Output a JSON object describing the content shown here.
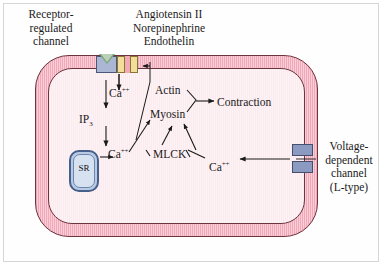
{
  "figure": {
    "type": "biological-pathway-diagram"
  },
  "labels": {
    "receptor_channel_line1": "Receptor-",
    "receptor_channel_line2": "regulated",
    "receptor_channel_line3": "channel",
    "agonist_1": "Angiotensin II",
    "agonist_2": "Norepinephrine",
    "agonist_3": "Endothelin",
    "voltage_channel_line1": "Voltage-",
    "voltage_channel_line2": "dependent",
    "voltage_channel_line3": "channel",
    "voltage_channel_line4": "(L-type)"
  },
  "molecules": {
    "calcium_influx": "Ca",
    "calcium_influx_charge": "++",
    "ip3": "IP",
    "ip3_subscript": "3",
    "calcium_sr": "Ca",
    "calcium_sr_charge": "++",
    "calcium_right": "Ca",
    "calcium_right_charge": "++",
    "actin": "Actin",
    "myosin": "Myosin",
    "mlck": "MLCK",
    "contraction": "Contraction",
    "sarcoplasmic_reticulum": "SR"
  },
  "colors": {
    "membrane": "#f3a8b8",
    "cytoplasm": "#fbeaee",
    "cell_outline": "#6b3540",
    "receptor_channel": "#aab6d4",
    "agonist_channel": "#f2dd9a",
    "voltage_channel": "#8a9ac0",
    "sr_body": "#b9cbe4",
    "sr_border": "#46608c",
    "ligand_triangle": "#7aa878",
    "text": "#1a1a1a",
    "frame_border": "#9a9a9a",
    "background": "#ffffff"
  }
}
